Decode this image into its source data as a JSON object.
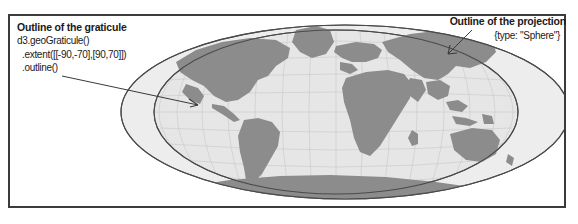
{
  "figure": {
    "frame_color": "#3b3b3b",
    "background": "#ffffff"
  },
  "annotations": {
    "graticule": {
      "title": "Outline of the graticule",
      "code_line_1": "d3.geoGraticule()",
      "code_line_2": "  .extent([[-90,-70],[90,70]])",
      "code_line_3": "  .outline()"
    },
    "projection": {
      "title": "Outline of the projection",
      "sub": "{type: \"Sphere\"}"
    }
  },
  "map": {
    "sphere_outline_color": "#4a4a4a",
    "graticule_outline_color": "#4a4a4a",
    "ocean_fill": "#e9e9e9",
    "land_fill": "#8a8a8a",
    "graticule_line_color": "#bdbdbd"
  }
}
